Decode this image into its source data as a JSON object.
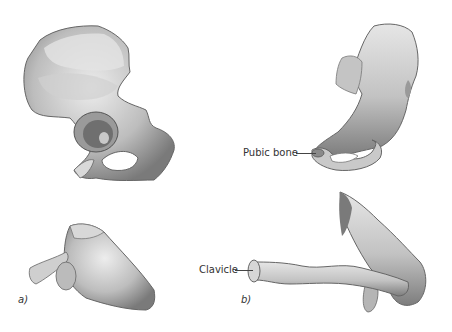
{
  "figure": {
    "panels": [
      {
        "id": "a",
        "label": "a)",
        "illustrations": [
          "hip-bone-lateral",
          "scapula"
        ]
      },
      {
        "id": "b",
        "label": "b)",
        "illustrations": [
          "hip-bone-anterior",
          "clavicle-and-scapula"
        ]
      }
    ],
    "annotations": [
      {
        "text": "Pubic bone",
        "target": "pubic-bone"
      },
      {
        "text": "Clavicle",
        "target": "clavicle"
      }
    ]
  },
  "colors": {
    "background": "#ffffff",
    "bone_light": "#e8e8e8",
    "bone_mid": "#b8b8b8",
    "bone_dark": "#6e6e6e",
    "label_text": "#333333"
  }
}
